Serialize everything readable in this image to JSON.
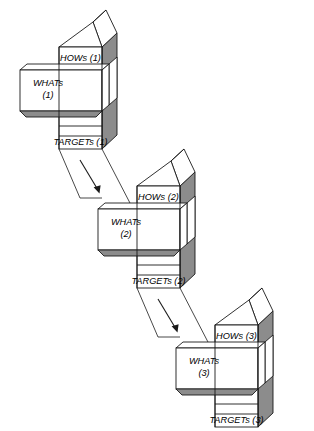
{
  "diagram": {
    "type": "house-of-quality-deployment",
    "background_color": "#ffffff",
    "line_color": "#1a1a1a",
    "shade_color": "#8c8c8c",
    "face_color": "#ffffff"
  },
  "houses": [
    {
      "id": "house-1",
      "hows_label": "HOWs (1)",
      "whats_label_line1": "WHATs",
      "whats_label_line2": "(1)",
      "targets_label": "TARGETs (1)"
    },
    {
      "id": "house-2",
      "hows_label": "HOWs (2)",
      "whats_label_line1": "WHATs",
      "whats_label_line2": "(2)",
      "targets_label": "TARGETs (2)"
    },
    {
      "id": "house-3",
      "hows_label": "HOWs (3)",
      "whats_label_line1": "WHATs",
      "whats_label_line2": "(3)",
      "targets_label": "TARGETs (3)"
    }
  ],
  "connections": [
    {
      "id": "deploy-1-to-2",
      "from": "TARGETs (1)",
      "to": "WHATs (2)"
    },
    {
      "id": "deploy-2-to-3",
      "from": "TARGETs (2)",
      "to": "WHATs (3)"
    }
  ]
}
